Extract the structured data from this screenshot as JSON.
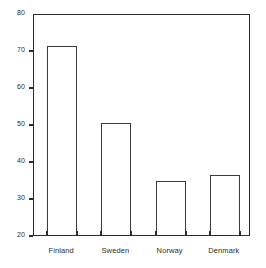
{
  "chart_data": {
    "type": "bar",
    "title": "",
    "subtitle": "",
    "xlabel": "",
    "ylabel": "",
    "categories": [
      "Finland",
      "Sweden",
      "Norway",
      "Denmark"
    ],
    "values": [
      71,
      50.3,
      34.7,
      36.2
    ],
    "ylim": [
      20,
      80
    ],
    "yticks": [
      80,
      70,
      60,
      50,
      40,
      30,
      20
    ],
    "ytick_labels": [
      "80",
      "70",
      "60",
      "50",
      "40",
      "30",
      "20"
    ],
    "grid": false,
    "legend": false,
    "legend_position": "none",
    "bar_style": {
      "fill": "#ffffff",
      "edge_color": "#3a3a3a"
    },
    "axis_color": "#2b2b2b"
  }
}
